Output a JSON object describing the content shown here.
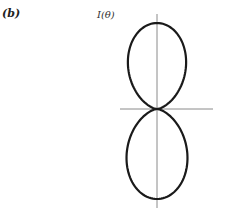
{
  "panel": {
    "label": "(b)"
  },
  "figure": {
    "y_axis_label": "I(θ)",
    "function": "I(θ) ∝ cos²θ",
    "colors": {
      "curve": "#1a1a1a",
      "axes": "#8a8a8a"
    }
  },
  "chart_data": {
    "type": "polar",
    "title": "",
    "ylabel": "I(θ)",
    "xlabel": "",
    "curve": "r = cos²θ (θ measured from vertical axis)",
    "lobes": [
      "upper",
      "lower"
    ],
    "grid": false
  }
}
